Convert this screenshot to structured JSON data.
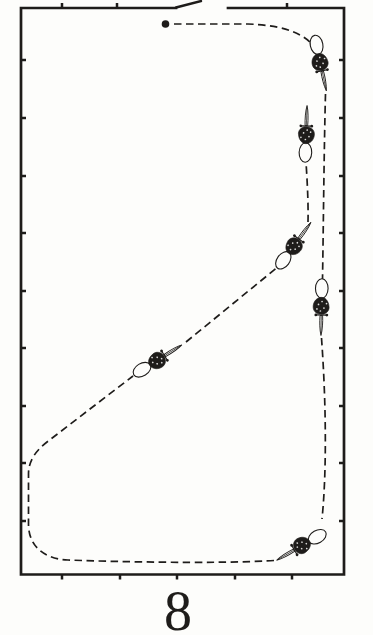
{
  "figure": {
    "caption_char": "8",
    "ink_color": "#1e1c1a",
    "paper_color": "#fdfdfb"
  },
  "diagram": {
    "canvas": {
      "width": 373,
      "height": 600
    },
    "border": {
      "x1": 21,
      "y1": 8,
      "x2": 344,
      "y2": 574.5,
      "stroke_width": 2.7,
      "gap_start": 176,
      "gap_end": 228,
      "tick_len": 5,
      "tick_width": 2.5,
      "ticks_left_right_y": [
        60,
        118,
        176,
        233,
        291,
        348,
        406,
        463,
        521
      ],
      "ticks_top_x": [
        62,
        117,
        287
      ],
      "ticks_bottom_x": [
        62,
        120,
        177,
        235,
        292
      ]
    },
    "door_leaf": {
      "x1": 176,
      "y1": 7.5,
      "x2": 201,
      "y2": 1,
      "stroke_width": 2.4
    },
    "start_dot": {
      "cx": 165.5,
      "cy": 24,
      "r": 3.8
    },
    "path": {
      "dash": "7.5 4.5",
      "stroke_width": 1.7,
      "segments": [
        "M 174 24 L 248 24 C 278 25 298 31 310 42",
        "M 325.5 94 C 324 150 323.5 220 322.5 280",
        "M 321.5 338 C 326 400 327 470 322 519",
        "M 274 560.5 C 240 563 150 563 68 560 C 45 559 28.5 547 28.5 524 L 28.5 474 C 28.5 461 35.5 451 47 442 L 133 376",
        "M 186 342 L 279 266",
        "M 308 222 C 308.5 202 307 178 306 162"
      ]
    },
    "riders": [
      {
        "id": "rider-1",
        "x": 320,
        "y": 61,
        "rotation": 168
      },
      {
        "id": "rider-2",
        "x": 306,
        "y": 136,
        "rotation": 2
      },
      {
        "id": "rider-3",
        "x": 293,
        "y": 247,
        "rotation": 36
      },
      {
        "id": "rider-4",
        "x": 321.5,
        "y": 305,
        "rotation": 181
      },
      {
        "id": "rider-5",
        "x": 303,
        "y": 545,
        "rotation": 240
      },
      {
        "id": "rider-6",
        "x": 156,
        "y": 361,
        "rotation": 58
      }
    ]
  }
}
